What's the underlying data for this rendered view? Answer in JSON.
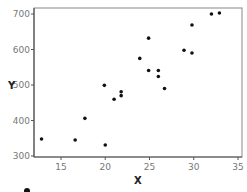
{
  "chart_data": {
    "type": "scatter",
    "title": "",
    "xlabel": "X",
    "ylabel": "Y",
    "xlim": [
      12,
      35.5
    ],
    "ylim": [
      295,
      715
    ],
    "xticks": [
      15,
      20,
      25,
      30,
      35
    ],
    "yticks": [
      300,
      400,
      500,
      600,
      700
    ],
    "xtick_labels": [
      "15",
      "20",
      "25",
      "30",
      "35"
    ],
    "ytick_labels": [
      "300",
      "400",
      "500",
      "600",
      "700"
    ],
    "grid": false,
    "legend": "none",
    "series": [
      {
        "name": "points",
        "color": "#111111",
        "points": [
          {
            "x": 12.8,
            "y": 348
          },
          {
            "x": 16.6,
            "y": 345
          },
          {
            "x": 17.7,
            "y": 406
          },
          {
            "x": 19.9,
            "y": 499
          },
          {
            "x": 20.0,
            "y": 331
          },
          {
            "x": 21.0,
            "y": 460
          },
          {
            "x": 21.8,
            "y": 470
          },
          {
            "x": 21.8,
            "y": 481
          },
          {
            "x": 23.9,
            "y": 575
          },
          {
            "x": 24.9,
            "y": 632
          },
          {
            "x": 24.9,
            "y": 541
          },
          {
            "x": 26.0,
            "y": 541
          },
          {
            "x": 26.0,
            "y": 524
          },
          {
            "x": 26.7,
            "y": 490
          },
          {
            "x": 28.9,
            "y": 598
          },
          {
            "x": 29.8,
            "y": 590
          },
          {
            "x": 29.8,
            "y": 669
          },
          {
            "x": 32.0,
            "y": 700
          },
          {
            "x": 32.9,
            "y": 703
          }
        ]
      }
    ]
  },
  "colors": {
    "axis": "#555555",
    "frame": "#888888",
    "marker": "#111111"
  }
}
